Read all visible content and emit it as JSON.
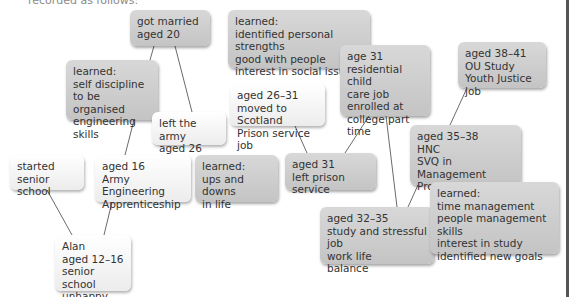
{
  "intro_text": "recorded as follows:",
  "boxes": {
    "got_married": "got married\naged 20",
    "learned_strengths": "learned:\nidentified personal strengths\ngood with people\ninterest in social issues",
    "age31_residential": "age 31\nresidential child\ncare job\nenrolled at\ncollege part time",
    "aged38_41": "aged 38–41\nOU Study\nYouth Justice job",
    "learned_discipline": "learned:\nself discipline\nto be organised\nengineering skills",
    "left_army": "left the army\naged 26",
    "aged26_31": "aged 26–31\nmoved to Scotland\nPrison service job",
    "started_senior": "started senior\nschool",
    "aged16": "aged 16\nArmy Engineering\nApprenticeship",
    "learned_ups": "learned:\nups and downs\nin life",
    "aged31_left_prison": "aged 31\nleft prison service",
    "aged35_38": "aged 35–38\nHNC\nSVQ in Management\nPromotion at work",
    "learned_time": "learned:\ntime management\npeople management skills\ninterest in study\nidentified new goals",
    "aged32_35": "aged 32–35\nstudy and stressful job\nwork life\nbalance",
    "alan": "Alan\naged 12–16\nsenior school\nunhappy"
  }
}
